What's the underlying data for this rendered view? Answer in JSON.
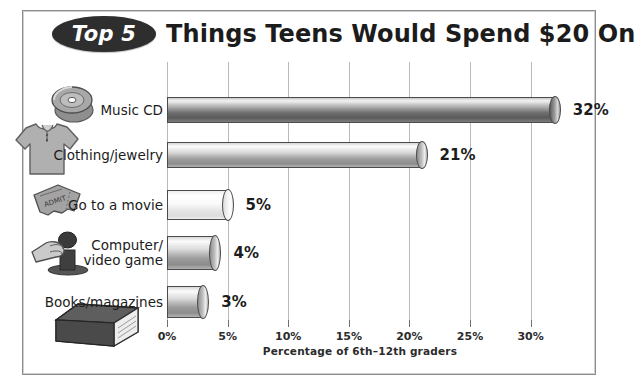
{
  "title": {
    "badge": "Top 5",
    "main": "Things Teens Would Spend $20 On"
  },
  "chart_data": {
    "type": "bar",
    "orientation": "horizontal",
    "title": "Top 5 Things Teens Would Spend $20 On",
    "xlabel": "Percentage of 6th–12th graders",
    "ylabel": "",
    "xlim": [
      0,
      32
    ],
    "xticks": [
      0,
      5,
      10,
      15,
      20,
      25,
      30
    ],
    "xticklabels": [
      "0%",
      "5%",
      "10%",
      "15%",
      "20%",
      "25%",
      "30%"
    ],
    "grid": "vertical",
    "legend": "none",
    "categories": [
      "Music CD",
      "Clothing/jewelry",
      "Go to a movie",
      "Computer/\nvideo game",
      "Books/magazines"
    ],
    "values": [
      32,
      21,
      5,
      4,
      3
    ],
    "datalabels": [
      "32%",
      "21%",
      "5%",
      "4%",
      "3%"
    ],
    "bar_styles": [
      "dark",
      "mid",
      "light",
      "mid",
      "mid"
    ],
    "icons": [
      "compact-disc-icon",
      "t-shirt-icon",
      "movie-ticket-icon",
      "joystick-hand-icon",
      "book-icon"
    ]
  },
  "colors": {
    "frame": "#8d8d8d",
    "gridline": "#b9b9b9",
    "text": "#1c1c1c",
    "badge_fill": "#2e2e2e",
    "badge_text": "#ffffff",
    "bar_outline": "#4a4a4a",
    "background": "#ffffff"
  }
}
